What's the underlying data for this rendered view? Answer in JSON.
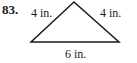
{
  "problem": {
    "number": "83.",
    "figure": "triangle",
    "sides": {
      "left": "4 in.",
      "right": "4 in.",
      "base": "6 in."
    }
  }
}
